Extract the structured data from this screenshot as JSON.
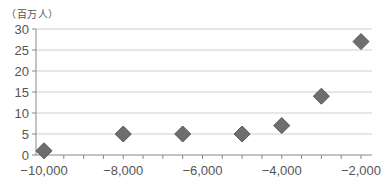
{
  "chart_data": {
    "type": "scatter",
    "title": "",
    "unit_label": "（百万人）",
    "xlabel": "",
    "ylabel": "（百万人）",
    "xlim": [
      -10400,
      -1800
    ],
    "ylim": [
      0,
      30
    ],
    "x_ticks": [
      -10000,
      -8000,
      -6000,
      -4000,
      -2000
    ],
    "x_tick_labels": [
      "−10,000",
      "−8,000",
      "−6,000",
      "−4,000",
      "−2,000"
    ],
    "x_minor_step": 500,
    "y_ticks": [
      0,
      5,
      10,
      15,
      20,
      25,
      30
    ],
    "y_tick_labels": [
      "0",
      "5",
      "10",
      "15",
      "20",
      "25",
      "30"
    ],
    "grid": "horizontal",
    "legend": null,
    "marker": "diamond",
    "marker_color": "#6e6e6e",
    "series": [
      {
        "name": "population",
        "points": [
          {
            "x": -10000,
            "y": 1
          },
          {
            "x": -8000,
            "y": 5
          },
          {
            "x": -6500,
            "y": 5
          },
          {
            "x": -5000,
            "y": 5
          },
          {
            "x": -4000,
            "y": 7
          },
          {
            "x": -3000,
            "y": 14
          },
          {
            "x": -2000,
            "y": 27
          }
        ]
      }
    ]
  }
}
